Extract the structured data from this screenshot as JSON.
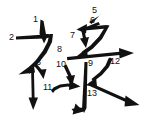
{
  "diagram": {
    "type": "stroke-order",
    "width": 147,
    "height": 124,
    "background_color": "#ffffff",
    "ink_color": "#111111",
    "total_strokes": 13,
    "stroke_numbers": [
      {
        "n": 1,
        "label": "1",
        "x": 33,
        "y": 15
      },
      {
        "n": 2,
        "label": "2",
        "x": 9,
        "y": 34
      },
      {
        "n": 3,
        "label": "3",
        "x": 36,
        "y": 60
      },
      {
        "n": 4,
        "label": "4",
        "x": 26,
        "y": 68
      },
      {
        "n": 5,
        "label": "5",
        "x": 92,
        "y": 8
      },
      {
        "n": 6,
        "label": "6",
        "x": 90,
        "y": 18
      },
      {
        "n": 7,
        "label": "7",
        "x": 71,
        "y": 33
      },
      {
        "n": 8,
        "label": "8",
        "x": 58,
        "y": 47
      },
      {
        "n": 9,
        "label": "9",
        "x": 88,
        "y": 61
      },
      {
        "n": 10,
        "label": "10",
        "x": 57,
        "y": 61
      },
      {
        "n": 11,
        "label": "11",
        "x": 44,
        "y": 84
      },
      {
        "n": 12,
        "label": "12",
        "x": 110,
        "y": 59
      },
      {
        "n": 13,
        "label": "13",
        "x": 88,
        "y": 91
      }
    ],
    "strokes": [
      {
        "n": 1,
        "name": "stroke-1-short-diagonal-left-radical-top"
      },
      {
        "n": 2,
        "name": "stroke-2-horizontal-then-sweep-left-radical"
      },
      {
        "n": 3,
        "name": "stroke-3-short-diagonal-left-radical"
      },
      {
        "n": 4,
        "name": "stroke-4-vertical-left-radical"
      },
      {
        "n": 5,
        "name": "stroke-5-short-diagonal-right-top"
      },
      {
        "n": 6,
        "name": "stroke-6-short-stroke-right-top"
      },
      {
        "n": 7,
        "name": "stroke-7-hook-right-top"
      },
      {
        "n": 8,
        "name": "stroke-8-long-horizontal"
      },
      {
        "n": 9,
        "name": "stroke-9-central-vertical"
      },
      {
        "n": 10,
        "name": "stroke-10-left-dot"
      },
      {
        "n": 11,
        "name": "stroke-11-left-sweep-up"
      },
      {
        "n": 12,
        "name": "stroke-12-right-sweep-in"
      },
      {
        "n": 13,
        "name": "stroke-13-right-diagonal-out"
      }
    ]
  }
}
